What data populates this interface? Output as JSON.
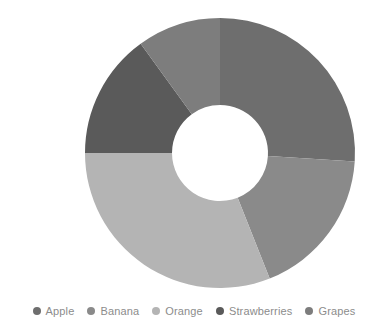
{
  "chart_data": {
    "type": "pie",
    "variant": "donut",
    "title": "",
    "subtitle": "",
    "xlabel": "",
    "ylabel": "",
    "grid": false,
    "legend_position": "bottom",
    "categories": [
      "Apple",
      "Banana",
      "Orange",
      "Strawberries",
      "Grapes"
    ],
    "values": [
      26,
      18,
      31,
      15,
      10
    ],
    "units": "percent",
    "series": [
      {
        "name": "Fruit share",
        "values": [
          26,
          18,
          31,
          15,
          10
        ]
      }
    ],
    "slices": [
      {
        "label": "Apple",
        "value": 26,
        "color": "#6e6e6e",
        "start_angle": 0,
        "end_angle": 93.6
      },
      {
        "label": "Banana",
        "value": 18,
        "color": "#8a8a8a",
        "start_angle": 93.6,
        "end_angle": 158.4
      },
      {
        "label": "Orange",
        "value": 31,
        "color": "#b4b4b4",
        "start_angle": 158.4,
        "end_angle": 270.0
      },
      {
        "label": "Strawberries",
        "value": 15,
        "color": "#5a5a5a",
        "start_angle": 270.0,
        "end_angle": 324.0
      },
      {
        "label": "Grapes",
        "value": 10,
        "color": "#7d7d7d",
        "start_angle": 324.0,
        "end_angle": 360.0
      }
    ],
    "geometry": {
      "center_x": 220,
      "center_y": 153,
      "outer_radius": 135,
      "inner_radius": 48,
      "start_at_twelve_oclock": true,
      "direction": "clockwise"
    },
    "colors": {
      "background": "#ffffff",
      "hole": "#ffffff",
      "legend_text": "#8c8c8c"
    }
  },
  "legend": {
    "items": [
      {
        "label": "Apple",
        "color": "#6e6e6e"
      },
      {
        "label": "Banana",
        "color": "#8a8a8a"
      },
      {
        "label": "Orange",
        "color": "#b4b4b4"
      },
      {
        "label": "Strawberries",
        "color": "#5a5a5a"
      },
      {
        "label": "Grapes",
        "color": "#7d7d7d"
      }
    ]
  }
}
